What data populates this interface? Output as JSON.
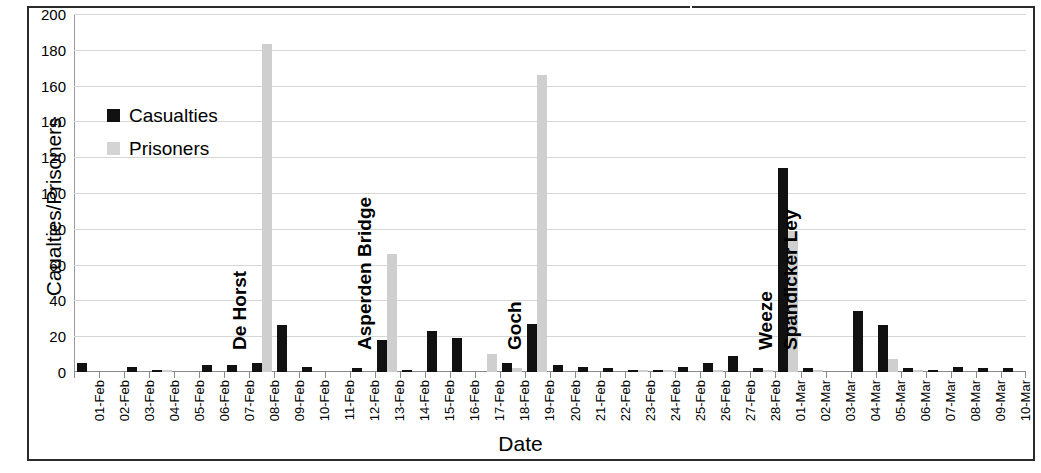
{
  "chart_data": {
    "type": "bar",
    "title": "",
    "xlabel": "Date",
    "ylabel": "Caualties/Prisoners",
    "ylim": [
      0,
      200
    ],
    "ytick_step": 20,
    "yticks": [
      200,
      180,
      160,
      140,
      120,
      100,
      80,
      60,
      40,
      20,
      0
    ],
    "grid": true,
    "legend_position": "upper-left-inside",
    "categories": [
      "01-Feb",
      "02-Feb",
      "03-Feb",
      "04-Feb",
      "05-Feb",
      "06-Feb",
      "07-Feb",
      "08-Feb",
      "09-Feb",
      "10-Feb",
      "11-Feb",
      "12-Feb",
      "13-Feb",
      "14-Feb",
      "15-Feb",
      "16-Feb",
      "17-Feb",
      "18-Feb",
      "19-Feb",
      "20-Feb",
      "21-Feb",
      "22-Feb",
      "23-Feb",
      "24-Feb",
      "25-Feb",
      "26-Feb",
      "27-Feb",
      "28-Feb",
      "01-Mar",
      "02-Mar",
      "03-Mar",
      "04-Mar",
      "05-Mar",
      "06-Mar",
      "07-Mar",
      "08-Mar",
      "09-Mar",
      "10-Mar"
    ],
    "series": [
      {
        "name": "Casualties",
        "color": "#111111",
        "values": [
          5,
          0,
          3,
          1,
          0,
          4,
          4,
          5,
          26,
          3,
          0,
          2,
          18,
          1,
          23,
          19,
          0,
          5,
          27,
          4,
          3,
          2,
          1,
          1,
          3,
          5,
          9,
          2,
          114,
          2,
          0,
          34,
          26,
          2,
          1,
          3,
          2,
          2
        ]
      },
      {
        "name": "Prisoners",
        "color": "#cfcfcf",
        "values": [
          0,
          0,
          0,
          1,
          0,
          0,
          0,
          183,
          0,
          0,
          0,
          0,
          66,
          0,
          0,
          0,
          10,
          2,
          166,
          0,
          0,
          0,
          1,
          1,
          0,
          1,
          0,
          1,
          79,
          1,
          0,
          0,
          7,
          1,
          0,
          0,
          0,
          0
        ]
      }
    ],
    "annotations": [
      {
        "label": "De Horst",
        "category": "08-Feb"
      },
      {
        "label": "Asperden Bridge",
        "category": "13-Feb"
      },
      {
        "label": "Goch",
        "category": "19-Feb"
      },
      {
        "label": "Weeze",
        "category": "01-Mar"
      },
      {
        "label": "Spandicker Ley",
        "category": "02-Mar"
      }
    ]
  },
  "legend": {
    "items": [
      {
        "label": "Casualties"
      },
      {
        "label": "Prisoners"
      }
    ]
  }
}
